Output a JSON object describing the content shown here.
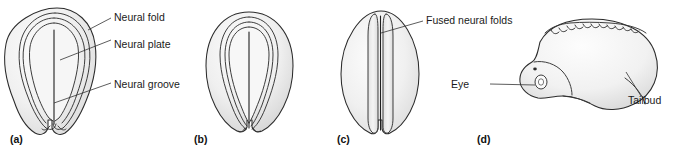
{
  "figure": {
    "background_color": "#ffffff",
    "ink_color": "#2b2b2b",
    "shade_color": "#e8e8e8"
  },
  "panels": [
    {
      "letter": "(a)",
      "name": "neural-plate-stage",
      "shape": "pear",
      "labels": [
        "Neural fold",
        "Neural plate",
        "Neural groove"
      ]
    },
    {
      "letter": "(b)",
      "name": "neural-groove-stage",
      "shape": "round",
      "labels": []
    },
    {
      "letter": "(c)",
      "name": "neural-tube-closure-stage",
      "shape": "teardrop",
      "labels": [
        "Fused neural folds"
      ]
    },
    {
      "letter": "(d)",
      "name": "tailbud-embryo-stage",
      "shape": "curled-embryo",
      "labels": [
        "Eye",
        "Tailbud"
      ]
    }
  ],
  "annotations": {
    "neural_fold": "Neural fold",
    "neural_plate": "Neural plate",
    "neural_groove": "Neural groove",
    "fused_neural_folds": "Fused neural folds",
    "eye": "Eye",
    "tailbud": "Tailbud"
  }
}
